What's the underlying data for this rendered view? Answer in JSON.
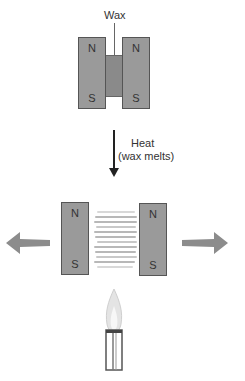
{
  "diagram": {
    "top_section": {
      "wax_label": "Wax",
      "left_magnet": {
        "top_pole": "N",
        "bottom_pole": "S"
      },
      "right_magnet": {
        "top_pole": "N",
        "bottom_pole": "S"
      }
    },
    "transition": {
      "label_line1": "Heat",
      "label_line2": "(wax melts)"
    },
    "bottom_section": {
      "left_magnet": {
        "top_pole": "N",
        "bottom_pole": "S"
      },
      "right_magnet": {
        "top_pole": "N",
        "bottom_pole": "S"
      },
      "left_arrow": "arrow pointing left (repulsion)",
      "right_arrow": "arrow pointing right (repulsion)",
      "heat_source": "burner flame"
    },
    "colors": {
      "magnet_fill": "#9a9a9a",
      "magnet_border": "#555555",
      "wax_fill": "#8a8a8a",
      "arrow_fill": "#8c8c8c",
      "text": "#333333"
    }
  }
}
